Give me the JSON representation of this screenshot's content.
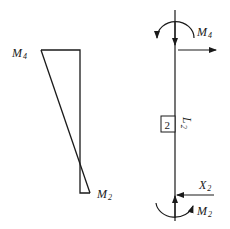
{
  "moment_diagram": {
    "top_label": "M",
    "top_sub": "4",
    "bottom_label": "M",
    "bottom_sub": "2"
  },
  "member": {
    "number": "2",
    "length_label": "L",
    "length_sub": "2",
    "top_moment_label": "M",
    "top_moment_sub": "4",
    "bottom_force_label": "X",
    "bottom_force_sub": "2",
    "bottom_moment_label": "M",
    "bottom_moment_sub": "2"
  },
  "colors": {
    "stroke": "#1a1a1a",
    "background": "#ffffff"
  }
}
